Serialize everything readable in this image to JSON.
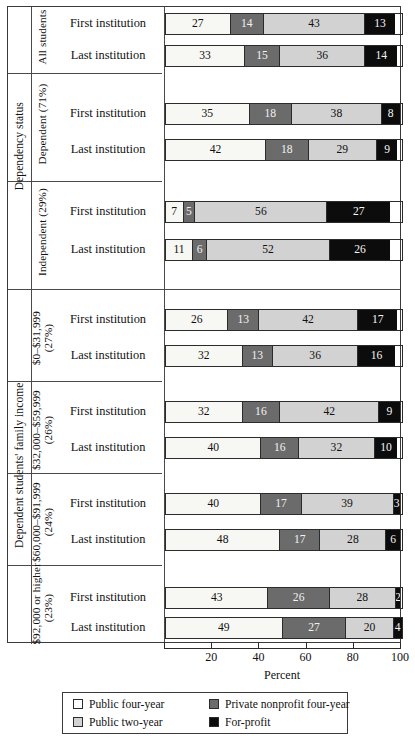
{
  "chart_data": {
    "type": "bar",
    "subtype": "stacked-horizontal-100pct",
    "title": "",
    "xlabel": "Percent",
    "ylabel": "",
    "xlim": [
      0,
      100
    ],
    "xticks": [
      20,
      40,
      60,
      80,
      100
    ],
    "xtick_labels": [
      "20",
      "40",
      "60",
      "80",
      "100"
    ],
    "grid": false,
    "legend_position": "bottom",
    "series": [
      {
        "name": "Public four-year",
        "key": "pub4",
        "color": "#f7f7f4"
      },
      {
        "name": "Private nonprofit four-year",
        "key": "priv4",
        "color": "#6b6b6b"
      },
      {
        "name": "Public two-year",
        "key": "pub2",
        "color": "#d2d2d2"
      },
      {
        "name": "For-profit",
        "key": "forp",
        "color": "#0c0c0c"
      }
    ],
    "groups": [
      {
        "outer_label": "Dependency status",
        "sub_label": "All students",
        "rows": [
          {
            "label": "First institution",
            "values": [
              27,
              14,
              43,
              13
            ]
          },
          {
            "label": "Last institution",
            "values": [
              33,
              15,
              36,
              14
            ]
          }
        ]
      },
      {
        "outer_label": "Dependency status",
        "sub_label": "Dependent (71%)",
        "rows": [
          {
            "label": "First institution",
            "values": [
              35,
              18,
              38,
              8
            ]
          },
          {
            "label": "Last institution",
            "values": [
              42,
              18,
              29,
              9
            ]
          }
        ]
      },
      {
        "outer_label": "Dependency status",
        "sub_label": "Independent (29%)",
        "rows": [
          {
            "label": "First institution",
            "values": [
              7,
              5,
              56,
              27
            ]
          },
          {
            "label": "Last institution",
            "values": [
              11,
              6,
              52,
              26
            ]
          }
        ]
      },
      {
        "outer_label": "Dependent students' family income",
        "sub_label": "$0–$31,999\n(27%)",
        "rows": [
          {
            "label": "First institution",
            "values": [
              26,
              13,
              42,
              17
            ]
          },
          {
            "label": "Last institution",
            "values": [
              32,
              13,
              36,
              16
            ]
          }
        ]
      },
      {
        "outer_label": "Dependent students' family income",
        "sub_label": "$32,000–$59,999\n(26%)",
        "rows": [
          {
            "label": "First institution",
            "values": [
              32,
              16,
              42,
              9
            ]
          },
          {
            "label": "Last institution",
            "values": [
              40,
              16,
              32,
              10
            ]
          }
        ]
      },
      {
        "outer_label": "Dependent students' family income",
        "sub_label": "$60,000–$91,999\n(24%)",
        "rows": [
          {
            "label": "First institution",
            "values": [
              40,
              17,
              39,
              3
            ]
          },
          {
            "label": "Last institution",
            "values": [
              48,
              17,
              28,
              6
            ]
          }
        ]
      },
      {
        "outer_label": "Dependent students' family income",
        "sub_label": "$92,000 or higher\n(23%)",
        "rows": [
          {
            "label": "First institution",
            "values": [
              43,
              26,
              28,
              2
            ]
          },
          {
            "label": "Last institution",
            "values": [
              49,
              27,
              20,
              4
            ]
          }
        ]
      }
    ]
  },
  "side_labels": {
    "outer": [
      {
        "text": "Dependency status"
      },
      {
        "text": "Dependent students' family income"
      }
    ],
    "sub": [
      {
        "text": "All students"
      },
      {
        "text": "Dependent (71%)"
      },
      {
        "text": "Independent (29%)"
      },
      {
        "text": "$0–$31,999",
        "text2": "(27%)"
      },
      {
        "text": "$32,000–$59,999",
        "text2": "(26%)"
      },
      {
        "text": "$60,000–$91,999",
        "text2": "(24%)"
      },
      {
        "text": "$92,000 or higher",
        "text2": "(23%)"
      }
    ]
  },
  "axis": {
    "title": "Percent",
    "ticks": [
      "20",
      "40",
      "60",
      "80",
      "100"
    ]
  },
  "legend": {
    "items": [
      {
        "label": "Public four-year",
        "swatch": "sw-pub4"
      },
      {
        "label": "Private nonprofit four-year",
        "swatch": "sw-priv4"
      },
      {
        "label": "Public two-year",
        "swatch": "sw-pub2"
      },
      {
        "label": "For-profit",
        "swatch": "sw-forp"
      }
    ]
  }
}
